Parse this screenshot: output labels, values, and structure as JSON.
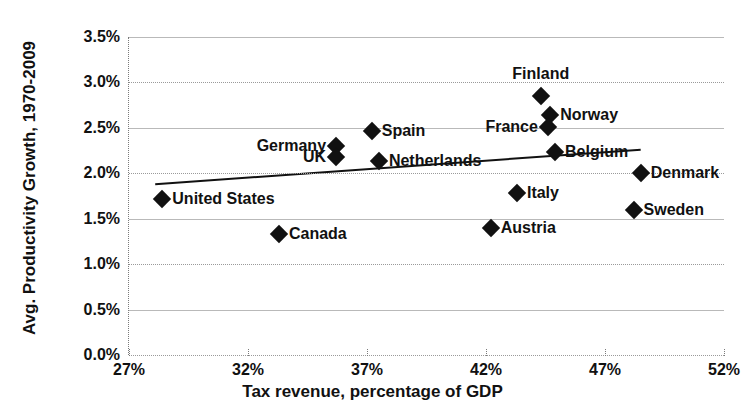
{
  "chart": {
    "title": "TAX REVENUE AS A % OF GDP AND PRODUCTIVITY GROWTH",
    "ylabel": "Avg. Productivity Growth, 1970-2009",
    "xlabel": "Tax revenue, percentage of GDP"
  },
  "chart_data": {
    "type": "scatter",
    "title": "TAX REVENUE AS A % OF GDP AND PRODUCTIVITY GROWTH",
    "xlabel": "Tax revenue, percentage of GDP",
    "ylabel": "Avg. Productivity Growth, 1970-2009",
    "xlim": [
      27,
      52
    ],
    "ylim": [
      0.0,
      3.5
    ],
    "xticks": [
      "27%",
      "32%",
      "37%",
      "42%",
      "47%",
      "52%"
    ],
    "yticks": [
      "0.0%",
      "0.5%",
      "1.0%",
      "1.5%",
      "2.0%",
      "2.5%",
      "3.0%",
      "3.5%"
    ],
    "xtick_values": [
      27,
      32,
      37,
      42,
      47,
      52
    ],
    "ytick_values": [
      0.0,
      0.5,
      1.0,
      1.5,
      2.0,
      2.5,
      3.0,
      3.5
    ],
    "grid": true,
    "legend": "none",
    "marker": "diamond",
    "marker_color": "#111111",
    "trendline": {
      "x0": 28.1,
      "y0": 1.88,
      "x1": 48.5,
      "y1": 2.26
    },
    "points": [
      {
        "label": "United States",
        "x": 28.4,
        "y": 1.72,
        "label_side": "right"
      },
      {
        "label": "Canada",
        "x": 33.3,
        "y": 1.33,
        "label_side": "right"
      },
      {
        "label": "Germany",
        "x": 35.7,
        "y": 2.3,
        "label_side": "left"
      },
      {
        "label": "UK",
        "x": 35.7,
        "y": 2.18,
        "label_side": "left"
      },
      {
        "label": "Spain",
        "x": 37.2,
        "y": 2.46,
        "label_side": "right"
      },
      {
        "label": "Netherlands",
        "x": 37.5,
        "y": 2.13,
        "label_side": "right"
      },
      {
        "label": "Austria",
        "x": 42.2,
        "y": 1.4,
        "label_side": "right"
      },
      {
        "label": "Italy",
        "x": 43.3,
        "y": 1.78,
        "label_side": "right"
      },
      {
        "label": "Finland",
        "x": 44.3,
        "y": 2.85,
        "label_side": "above"
      },
      {
        "label": "Norway",
        "x": 44.7,
        "y": 2.64,
        "label_side": "right"
      },
      {
        "label": "France",
        "x": 44.6,
        "y": 2.51,
        "label_side": "left"
      },
      {
        "label": "Belgium",
        "x": 44.9,
        "y": 2.23,
        "label_side": "right"
      },
      {
        "label": "Denmark",
        "x": 48.5,
        "y": 2.0,
        "label_side": "right"
      },
      {
        "label": "Sweden",
        "x": 48.2,
        "y": 1.6,
        "label_side": "right"
      }
    ]
  }
}
